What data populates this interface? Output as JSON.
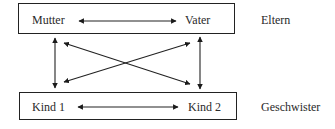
{
  "diagram": {
    "top_group": {
      "left_node": "Mutter",
      "right_node": "Vater",
      "group_label": "Eltern"
    },
    "bottom_group": {
      "left_node": "Kind 1",
      "right_node": "Kind 2",
      "group_label": "Geschwister"
    },
    "edges": [
      {
        "from": "Mutter",
        "to": "Vater",
        "type": "bidirectional"
      },
      {
        "from": "Kind 1",
        "to": "Kind 2",
        "type": "bidirectional"
      },
      {
        "from": "Mutter",
        "to": "Kind 1",
        "type": "bidirectional"
      },
      {
        "from": "Vater",
        "to": "Kind 2",
        "type": "bidirectional"
      },
      {
        "from": "Mutter",
        "to": "Kind 2",
        "type": "bidirectional"
      },
      {
        "from": "Vater",
        "to": "Kind 1",
        "type": "bidirectional"
      }
    ]
  }
}
